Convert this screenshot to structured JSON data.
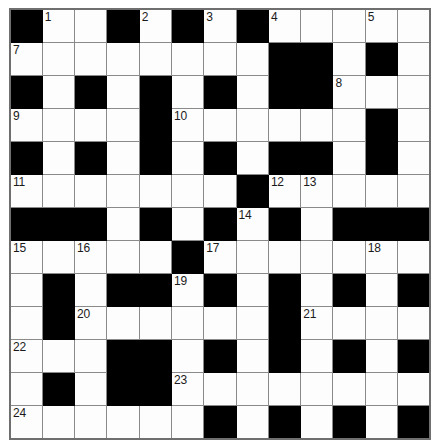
{
  "puzzle": {
    "type": "crossword-grid",
    "columns": 13,
    "rows": 13,
    "colors": {
      "block": "#000000",
      "cell": "#fdfdfd",
      "grid_line": "#8a8a8a",
      "border": "#6f6f6f",
      "number_text": "#1a1a1a",
      "page_background": "#ffffff"
    },
    "legend": {
      "block_code": "#",
      "open_code": "."
    },
    "grid": [
      "#..#.#.#...#..",
      "........##.#.",
      "#.#.#.#.##...",
      "....#......#.",
      "#.#.#.#.##.#.",
      ".......#.....",
      "###.#.#.#.###",
      ".....#.......",
      ".#.##.#.#.#.#",
      ".#......#....",
      "...##.#.#.#.#",
      ".#.##........",
      "......#.#.#.#"
    ],
    "grid_rows": [
      [
        "block",
        "open",
        "open",
        "block",
        "open",
        "block",
        "open",
        "block",
        "open",
        "open",
        "open",
        "open",
        "open"
      ],
      [
        "open",
        "open",
        "open",
        "open",
        "open",
        "open",
        "open",
        "open",
        "block",
        "block",
        "open",
        "block",
        "open"
      ],
      [
        "block",
        "open",
        "block",
        "open",
        "block",
        "open",
        "block",
        "open",
        "block",
        "block",
        "open",
        "open",
        "open"
      ],
      [
        "open",
        "open",
        "open",
        "open",
        "block",
        "open",
        "open",
        "open",
        "open",
        "open",
        "open",
        "block",
        "open"
      ],
      [
        "block",
        "open",
        "block",
        "open",
        "block",
        "open",
        "block",
        "open",
        "block",
        "block",
        "open",
        "block",
        "open"
      ],
      [
        "open",
        "open",
        "open",
        "open",
        "open",
        "open",
        "open",
        "block",
        "open",
        "open",
        "open",
        "open",
        "open"
      ],
      [
        "block",
        "block",
        "block",
        "open",
        "block",
        "open",
        "block",
        "open",
        "block",
        "open",
        "block",
        "block",
        "block"
      ],
      [
        "open",
        "open",
        "open",
        "open",
        "open",
        "block",
        "open",
        "open",
        "open",
        "open",
        "open",
        "open",
        "open"
      ],
      [
        "open",
        "block",
        "open",
        "block",
        "block",
        "open",
        "block",
        "open",
        "block",
        "open",
        "block",
        "open",
        "block"
      ],
      [
        "open",
        "block",
        "open",
        "open",
        "open",
        "open",
        "open",
        "open",
        "block",
        "open",
        "open",
        "open",
        "open"
      ],
      [
        "open",
        "open",
        "open",
        "block",
        "block",
        "open",
        "block",
        "open",
        "block",
        "open",
        "block",
        "open",
        "block"
      ],
      [
        "open",
        "block",
        "open",
        "block",
        "block",
        "open",
        "open",
        "open",
        "open",
        "open",
        "open",
        "open",
        "open"
      ],
      [
        "open",
        "open",
        "open",
        "open",
        "open",
        "open",
        "block",
        "open",
        "block",
        "open",
        "block",
        "open",
        "block"
      ]
    ],
    "numbers": [
      {
        "number": "1",
        "row": 0,
        "col": 1
      },
      {
        "number": "2",
        "row": 0,
        "col": 4
      },
      {
        "number": "3",
        "row": 0,
        "col": 6
      },
      {
        "number": "4",
        "row": 0,
        "col": 8
      },
      {
        "number": "5",
        "row": 0,
        "col": 11
      },
      {
        "number": "6",
        "row": 0,
        "col": 13
      },
      {
        "number": "7",
        "row": 1,
        "col": 0
      },
      {
        "number": "8",
        "row": 2,
        "col": 10
      },
      {
        "number": "9",
        "row": 3,
        "col": 0
      },
      {
        "number": "10",
        "row": 3,
        "col": 5
      },
      {
        "number": "11",
        "row": 5,
        "col": 0
      },
      {
        "number": "12",
        "row": 5,
        "col": 8
      },
      {
        "number": "13",
        "row": 5,
        "col": 9
      },
      {
        "number": "14",
        "row": 6,
        "col": 7
      },
      {
        "number": "15",
        "row": 7,
        "col": 0
      },
      {
        "number": "16",
        "row": 7,
        "col": 2
      },
      {
        "number": "17",
        "row": 7,
        "col": 6
      },
      {
        "number": "18",
        "row": 7,
        "col": 11
      },
      {
        "number": "19",
        "row": 8,
        "col": 5
      },
      {
        "number": "20",
        "row": 9,
        "col": 2
      },
      {
        "number": "21",
        "row": 9,
        "col": 9
      },
      {
        "number": "22",
        "row": 10,
        "col": 0
      },
      {
        "number": "23",
        "row": 11,
        "col": 5
      },
      {
        "number": "24",
        "row": 12,
        "col": 0
      }
    ]
  }
}
